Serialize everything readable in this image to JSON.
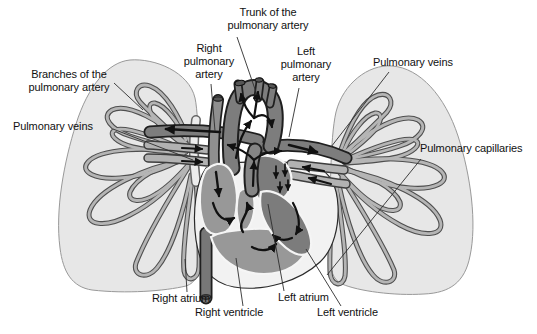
{
  "diagram": {
    "type": "anatomical-illustration",
    "labels": {
      "trunk": "Trunk of the\npulmonary artery",
      "right_pa": "Right\npulmonary\nartery",
      "left_pa": "Left\npulmonary\nartery",
      "veins_right": "Pulmonary veins",
      "branches": "Branches of the\npulmonary artery",
      "veins_left": "Pulmonary veins",
      "capillaries": "Pulmonary capillaries",
      "right_atrium": "Right atrium",
      "right_ventricle": "Right ventricle",
      "left_atrium": "Left atrium",
      "left_ventricle": "Left ventricle"
    },
    "colors": {
      "background": "#ffffff",
      "lung_fill": "#e7e7e7",
      "lung_outline": "#999999",
      "vessel_tube": "#b5b5b5",
      "vessel_outline": "#4f4f4f",
      "artery_fill": "#7d7d7d",
      "outline_dark": "#1f1f1f",
      "vein_fill": "#b2b2b2",
      "chamber_light": "#989898",
      "chamber_dark": "#7c7c7c",
      "heart_wall": "#f2f2f2",
      "label_text": "#111111",
      "arrow": "#111111"
    }
  }
}
